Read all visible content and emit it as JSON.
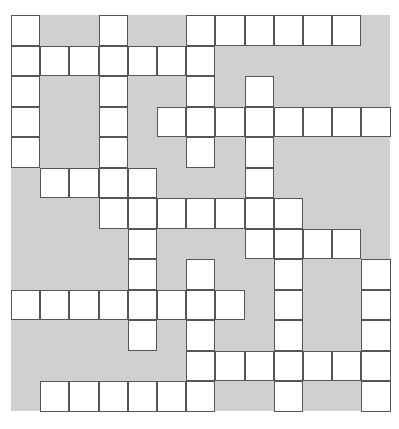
{
  "puzzle": {
    "type": "crossword",
    "rows": 13,
    "cols": 13,
    "colors": {
      "block": "#d0d0d0",
      "cell": "#ffffff",
      "border": "#555555"
    },
    "white_cells": [
      [
        0,
        0
      ],
      [
        0,
        3
      ],
      [
        0,
        6
      ],
      [
        0,
        7
      ],
      [
        0,
        8
      ],
      [
        0,
        9
      ],
      [
        0,
        10
      ],
      [
        0,
        11
      ],
      [
        1,
        0
      ],
      [
        1,
        1
      ],
      [
        1,
        2
      ],
      [
        1,
        3
      ],
      [
        1,
        4
      ],
      [
        1,
        5
      ],
      [
        1,
        6
      ],
      [
        2,
        0
      ],
      [
        2,
        3
      ],
      [
        2,
        6
      ],
      [
        2,
        8
      ],
      [
        3,
        0
      ],
      [
        3,
        3
      ],
      [
        3,
        5
      ],
      [
        3,
        6
      ],
      [
        3,
        7
      ],
      [
        3,
        8
      ],
      [
        3,
        9
      ],
      [
        3,
        10
      ],
      [
        3,
        11
      ],
      [
        3,
        12
      ],
      [
        4,
        0
      ],
      [
        4,
        3
      ],
      [
        4,
        6
      ],
      [
        4,
        8
      ],
      [
        5,
        1
      ],
      [
        5,
        2
      ],
      [
        5,
        3
      ],
      [
        5,
        4
      ],
      [
        5,
        8
      ],
      [
        6,
        3
      ],
      [
        6,
        4
      ],
      [
        6,
        5
      ],
      [
        6,
        6
      ],
      [
        6,
        7
      ],
      [
        6,
        8
      ],
      [
        6,
        9
      ],
      [
        7,
        4
      ],
      [
        7,
        8
      ],
      [
        7,
        9
      ],
      [
        7,
        10
      ],
      [
        7,
        11
      ],
      [
        8,
        4
      ],
      [
        8,
        6
      ],
      [
        8,
        9
      ],
      [
        8,
        12
      ],
      [
        9,
        0
      ],
      [
        9,
        1
      ],
      [
        9,
        2
      ],
      [
        9,
        3
      ],
      [
        9,
        4
      ],
      [
        9,
        5
      ],
      [
        9,
        6
      ],
      [
        9,
        7
      ],
      [
        9,
        9
      ],
      [
        9,
        12
      ],
      [
        10,
        4
      ],
      [
        10,
        6
      ],
      [
        10,
        9
      ],
      [
        10,
        12
      ],
      [
        11,
        6
      ],
      [
        11,
        7
      ],
      [
        11,
        8
      ],
      [
        11,
        9
      ],
      [
        11,
        10
      ],
      [
        11,
        11
      ],
      [
        11,
        12
      ],
      [
        12,
        1
      ],
      [
        12,
        2
      ],
      [
        12,
        3
      ],
      [
        12,
        4
      ],
      [
        12,
        5
      ],
      [
        12,
        6
      ],
      [
        12,
        9
      ],
      [
        12,
        12
      ]
    ]
  }
}
